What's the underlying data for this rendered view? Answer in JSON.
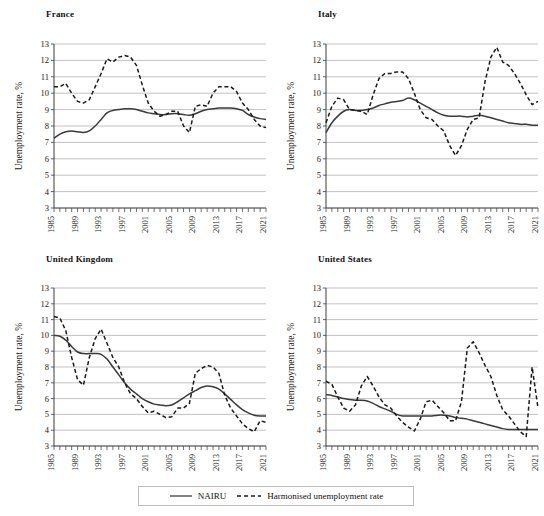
{
  "figure": {
    "width": 544,
    "height": 516,
    "background": "#ffffff"
  },
  "style": {
    "gridline_color": "#b4b4b4",
    "axis_color": "#4d4d4d",
    "nairu_color": "#3a3a3a",
    "harmonised_color": "#1a1a1a",
    "text_color": "#1a1a1a"
  },
  "legend": {
    "entries": [
      {
        "label": "NAIRU",
        "style": "solid",
        "icon": "solid-line-icon"
      },
      {
        "label": "Harmonised unemployment rate",
        "style": "dashed",
        "icon": "dashed-line-icon"
      }
    ]
  },
  "axis": {
    "ylabel": "Unemployment rate, %",
    "yticks": [
      3,
      4,
      5,
      6,
      7,
      8,
      9,
      10,
      11,
      12,
      13
    ],
    "ylim": [
      3,
      13
    ],
    "xlim": [
      1985,
      2021
    ],
    "xticks_labeled": [
      1985,
      1989,
      1993,
      1997,
      2001,
      2005,
      2009,
      2013,
      2017,
      2021
    ],
    "xtick_step_minor": 1
  },
  "chart_data": [
    {
      "id": "france",
      "type": "line",
      "title": "France",
      "xlabel": "",
      "ylabel": "Unemployment rate, %",
      "ylim": [
        3,
        13
      ],
      "xlim": [
        1985,
        2021
      ],
      "grid": true,
      "legend_position": "below-figure",
      "x": [
        1985,
        1986,
        1987,
        1988,
        1989,
        1990,
        1991,
        1992,
        1993,
        1994,
        1995,
        1996,
        1997,
        1998,
        1999,
        2000,
        2001,
        2002,
        2003,
        2004,
        2005,
        2006,
        2007,
        2008,
        2009,
        2010,
        2011,
        2012,
        2013,
        2014,
        2015,
        2016,
        2017,
        2018,
        2019,
        2020,
        2021
      ],
      "series": [
        {
          "name": "NAIRU",
          "style": "solid",
          "values": [
            7.25,
            7.5,
            7.65,
            7.7,
            7.65,
            7.6,
            7.7,
            8.0,
            8.4,
            8.8,
            8.95,
            9.0,
            9.05,
            9.05,
            9.0,
            8.9,
            8.8,
            8.75,
            8.7,
            8.7,
            8.75,
            8.75,
            8.7,
            8.65,
            8.75,
            8.9,
            9.0,
            9.05,
            9.1,
            9.1,
            9.1,
            9.05,
            8.95,
            8.7,
            8.55,
            8.45,
            8.4
          ]
        },
        {
          "name": "Harmonised unemployment rate",
          "style": "dashed",
          "values": [
            10.4,
            10.4,
            10.6,
            10.0,
            9.5,
            9.4,
            9.6,
            10.4,
            11.2,
            12.1,
            11.9,
            12.2,
            12.3,
            12.2,
            11.7,
            10.5,
            9.4,
            8.9,
            8.6,
            8.7,
            8.9,
            8.9,
            8.0,
            7.6,
            9.2,
            9.3,
            9.2,
            10.0,
            10.4,
            10.4,
            10.4,
            10.1,
            9.4,
            9.0,
            8.4,
            8.0,
            7.9
          ]
        }
      ]
    },
    {
      "id": "italy",
      "type": "line",
      "title": "Italy",
      "xlabel": "",
      "ylabel": "Unemployment rate, %",
      "ylim": [
        3,
        13
      ],
      "xlim": [
        1985,
        2021
      ],
      "grid": true,
      "legend_position": "below-figure",
      "x": [
        1985,
        1986,
        1987,
        1988,
        1989,
        1990,
        1991,
        1992,
        1993,
        1994,
        1995,
        1996,
        1997,
        1998,
        1999,
        2000,
        2001,
        2002,
        2003,
        2004,
        2005,
        2006,
        2007,
        2008,
        2009,
        2010,
        2011,
        2012,
        2013,
        2014,
        2015,
        2016,
        2017,
        2018,
        2019,
        2020,
        2021
      ],
      "series": [
        {
          "name": "NAIRU",
          "style": "solid",
          "values": [
            7.6,
            8.2,
            8.6,
            8.9,
            9.0,
            8.95,
            8.95,
            9.0,
            9.1,
            9.25,
            9.35,
            9.45,
            9.5,
            9.55,
            9.7,
            9.6,
            9.4,
            9.2,
            9.0,
            8.8,
            8.65,
            8.6,
            8.6,
            8.6,
            8.55,
            8.6,
            8.65,
            8.6,
            8.5,
            8.4,
            8.3,
            8.2,
            8.15,
            8.1,
            8.1,
            8.05,
            8.05
          ]
        },
        {
          "name": "Harmonised unemployment rate",
          "style": "dashed",
          "values": [
            8.2,
            9.2,
            9.7,
            9.6,
            9.0,
            8.95,
            8.9,
            8.7,
            9.9,
            10.9,
            11.2,
            11.2,
            11.3,
            11.3,
            10.9,
            10.0,
            9.0,
            8.5,
            8.4,
            8.0,
            7.7,
            6.8,
            6.2,
            6.8,
            7.8,
            8.4,
            8.5,
            10.7,
            12.2,
            12.8,
            11.9,
            11.7,
            11.2,
            10.6,
            9.9,
            9.3,
            9.5
          ]
        }
      ]
    },
    {
      "id": "united-kingdom",
      "type": "line",
      "title": "United Kingdom",
      "xlabel": "",
      "ylabel": "Unemployment rate, %",
      "ylim": [
        3,
        13
      ],
      "xlim": [
        1985,
        2021
      ],
      "grid": true,
      "legend_position": "below-figure",
      "x": [
        1985,
        1986,
        1987,
        1988,
        1989,
        1990,
        1991,
        1992,
        1993,
        1994,
        1995,
        1996,
        1997,
        1998,
        1999,
        2000,
        2001,
        2002,
        2003,
        2004,
        2005,
        2006,
        2007,
        2008,
        2009,
        2010,
        2011,
        2012,
        2013,
        2014,
        2015,
        2016,
        2017,
        2018,
        2019,
        2020,
        2021
      ],
      "series": [
        {
          "name": "NAIRU",
          "style": "solid",
          "values": [
            10.0,
            9.95,
            9.7,
            9.3,
            8.95,
            8.85,
            8.85,
            8.85,
            8.8,
            8.5,
            8.0,
            7.5,
            7.0,
            6.6,
            6.3,
            6.0,
            5.8,
            5.65,
            5.6,
            5.55,
            5.6,
            5.8,
            6.05,
            6.3,
            6.5,
            6.7,
            6.8,
            6.75,
            6.6,
            6.3,
            5.95,
            5.6,
            5.3,
            5.1,
            4.95,
            4.9,
            4.9
          ]
        },
        {
          "name": "Harmonised unemployment rate",
          "style": "dashed",
          "values": [
            11.2,
            11.1,
            10.3,
            8.6,
            7.2,
            6.85,
            8.6,
            9.8,
            10.4,
            9.5,
            8.6,
            8.0,
            7.0,
            6.3,
            6.0,
            5.5,
            5.1,
            5.2,
            5.0,
            4.8,
            4.85,
            5.4,
            5.4,
            5.7,
            7.6,
            7.9,
            8.1,
            8.0,
            7.6,
            6.2,
            5.4,
            4.9,
            4.4,
            4.1,
            3.9,
            4.6,
            4.5
          ]
        }
      ]
    },
    {
      "id": "united-states",
      "type": "line",
      "title": "United States",
      "xlabel": "",
      "ylabel": "Unemployment rate, %",
      "ylim": [
        3,
        13
      ],
      "xlim": [
        1985,
        2021
      ],
      "grid": true,
      "legend_position": "below-figure",
      "x": [
        1985,
        1986,
        1987,
        1988,
        1989,
        1990,
        1991,
        1992,
        1993,
        1994,
        1995,
        1996,
        1997,
        1998,
        1999,
        2000,
        2001,
        2002,
        2003,
        2004,
        2005,
        2006,
        2007,
        2008,
        2009,
        2010,
        2011,
        2012,
        2013,
        2014,
        2015,
        2016,
        2017,
        2018,
        2019,
        2020,
        2021
      ],
      "series": [
        {
          "name": "NAIRU",
          "style": "solid",
          "values": [
            6.25,
            6.2,
            6.1,
            6.0,
            5.95,
            5.9,
            5.9,
            5.85,
            5.7,
            5.5,
            5.35,
            5.2,
            5.0,
            4.9,
            4.9,
            4.9,
            4.9,
            4.9,
            4.9,
            4.95,
            4.95,
            4.9,
            4.8,
            4.75,
            4.7,
            4.6,
            4.5,
            4.4,
            4.3,
            4.2,
            4.1,
            4.05,
            4.05,
            4.05,
            4.05,
            4.05,
            4.05
          ]
        },
        {
          "name": "Harmonised unemployment rate",
          "style": "dashed",
          "values": [
            7.1,
            6.9,
            6.1,
            5.4,
            5.2,
            5.6,
            6.8,
            7.4,
            6.8,
            6.1,
            5.6,
            5.4,
            4.9,
            4.5,
            4.2,
            3.95,
            4.7,
            5.8,
            5.9,
            5.5,
            5.1,
            4.6,
            4.6,
            5.8,
            9.2,
            9.6,
            8.9,
            8.1,
            7.4,
            6.2,
            5.3,
            4.9,
            4.4,
            3.9,
            3.6,
            8.0,
            5.4
          ]
        }
      ]
    }
  ]
}
